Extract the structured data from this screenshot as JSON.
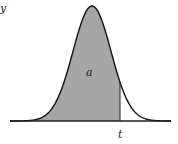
{
  "diagram": {
    "type": "distribution-curve",
    "y_axis_label": "y",
    "area_label": "a",
    "cutoff_label": "t",
    "colors": {
      "shade": "#a6a6a6",
      "curve": "#111111",
      "baseline": "#222222"
    }
  }
}
